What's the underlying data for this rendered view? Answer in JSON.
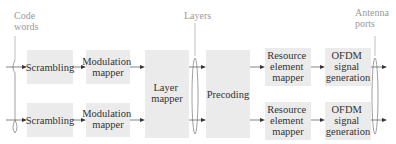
{
  "diagram": {
    "group_labels": {
      "code_words": [
        "Code",
        "words"
      ],
      "layers": [
        "Layers"
      ],
      "antenna_ports": [
        "Antenna",
        "ports"
      ]
    },
    "rows": [
      {
        "scrambling": [
          "Scrambling"
        ],
        "modulation_mapper": [
          "Modulation",
          "mapper"
        ],
        "resource_element_mapper": [
          "Resource",
          "element",
          "mapper"
        ],
        "ofdm_signal_generation": [
          "OFDM",
          "signal",
          "generation"
        ]
      },
      {
        "scrambling": [
          "Scrambling"
        ],
        "modulation_mapper": [
          "Modulation",
          "mapper"
        ],
        "resource_element_mapper": [
          "Resource",
          "element",
          "mapper"
        ],
        "ofdm_signal_generation": [
          "OFDM",
          "signal",
          "generation"
        ]
      }
    ],
    "shared_blocks": {
      "layer_mapper": [
        "Layer",
        "mapper"
      ],
      "precoding": [
        "Precoding"
      ]
    }
  }
}
